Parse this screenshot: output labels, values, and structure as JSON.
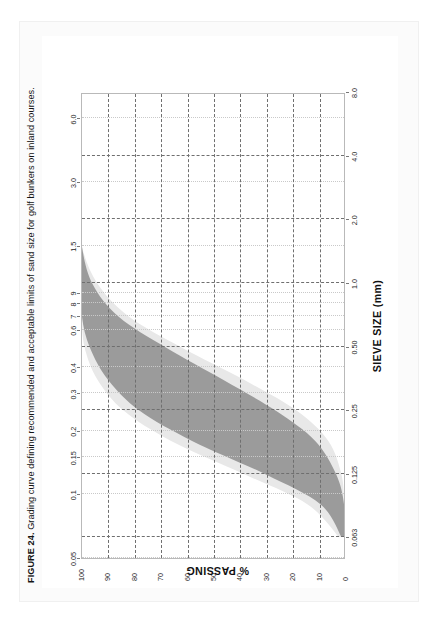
{
  "figure": {
    "caption_label": "FIGURE 24.",
    "caption_text": " Grading curve defining recommended and acceptable limits of sand size for golf bunkers on inland courses."
  },
  "colors": {
    "recommended_band": "#9b9b9b",
    "acceptable_band": "#e8e8e8",
    "gridline": "#6f6f6f",
    "axis": "#b9b9b9",
    "page_border": "#f0f0f0",
    "sheet_background": "#fbfbfb"
  },
  "chart_data": {
    "type": "area",
    "title": "",
    "xlabel": "SIEVE SIZE (mm)",
    "ylabel": "% PASSING",
    "grid": true,
    "legend_position": "none",
    "orientation": "rotated-90-ccw",
    "x_scale": "log",
    "xlim": [
      0.05,
      8.0
    ],
    "ylim": [
      0,
      100
    ],
    "x_ticks_bottom": [
      "0.063",
      "0.125",
      "0.25",
      "0.50",
      "1.0",
      "2.0",
      "4.0",
      "8.0"
    ],
    "x_ticks_bottom_values": [
      0.063,
      0.125,
      0.25,
      0.5,
      1.0,
      2.0,
      4.0,
      8.0
    ],
    "x_ticks_top": [
      "0.05",
      "0.1",
      "0.15",
      "0.2",
      "0.3",
      "0.4",
      "0.6",
      "7",
      "8",
      "9",
      "1.5",
      "3.0",
      "6.0"
    ],
    "x_ticks_top_values": [
      0.05,
      0.1,
      0.15,
      0.2,
      0.3,
      0.4,
      0.6,
      0.7,
      0.8,
      0.9,
      1.5,
      3.0,
      6.0
    ],
    "y_ticks": [
      "0",
      "10",
      "20",
      "30",
      "40",
      "50",
      "60",
      "70",
      "80",
      "90",
      "100"
    ],
    "y_tick_values": [
      0,
      10,
      20,
      30,
      40,
      50,
      60,
      70,
      80,
      90,
      100
    ],
    "series": [
      {
        "name": "acceptable limits (outer band)",
        "kind": "band",
        "fill": "#e8e8e8",
        "x": [
          0.063,
          0.09,
          0.125,
          0.18,
          0.25,
          0.35,
          0.5,
          0.7,
          1.0,
          1.5,
          2.0
        ],
        "upper": [
          2,
          14,
          38,
          66,
          84,
          94,
          99,
          100,
          100,
          100,
          100
        ],
        "lower": [
          0,
          0,
          1,
          6,
          18,
          38,
          62,
          82,
          94,
          100,
          100
        ]
      },
      {
        "name": "recommended limits (inner band)",
        "kind": "band",
        "fill": "#9b9b9b",
        "x": [
          0.063,
          0.09,
          0.125,
          0.18,
          0.25,
          0.35,
          0.5,
          0.7,
          1.0,
          1.5,
          2.0
        ],
        "upper": [
          1,
          9,
          30,
          58,
          78,
          90,
          97,
          100,
          100,
          100,
          100
        ],
        "lower": [
          0,
          0,
          3,
          11,
          26,
          46,
          68,
          86,
          96,
          100,
          100
        ]
      }
    ]
  }
}
